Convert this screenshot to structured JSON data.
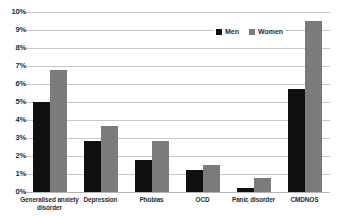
{
  "chart_data": {
    "type": "bar",
    "title": "",
    "subtitle": "",
    "xlabel": "",
    "ylabel": "",
    "ylim": [
      0,
      10
    ],
    "ytick_labels": [
      "10%",
      "9%",
      "8%",
      "7%",
      "6%",
      "5%",
      "4%",
      "3%",
      "2%",
      "1%",
      "0%"
    ],
    "ytick_values": [
      10,
      9,
      8,
      7,
      6,
      5,
      4,
      3,
      2,
      1,
      0
    ],
    "grid": true,
    "legend_position": "top-right",
    "value_unit": "%",
    "categories": [
      "Generalised anxiety disorder",
      "Depression",
      "Phobias",
      "OCD",
      "Panic disorder",
      "CMDNOS"
    ],
    "category_lines": [
      [
        "Generalised anxiety",
        "disorder"
      ],
      [
        "Depression"
      ],
      [
        "Phobias"
      ],
      [
        "OCD"
      ],
      [
        "Panic disorder"
      ],
      [
        "CMDNOS"
      ]
    ],
    "series": [
      {
        "name": "Men",
        "color": "#101010",
        "values": [
          5.0,
          2.85,
          1.8,
          1.2,
          0.2,
          5.75
        ]
      },
      {
        "name": "Women",
        "color": "#7b7b7b",
        "values": [
          6.8,
          3.65,
          2.85,
          1.5,
          0.8,
          9.5
        ]
      }
    ]
  },
  "legend": {
    "items": [
      {
        "label": "Men",
        "color": "#101010"
      },
      {
        "label": "Women",
        "color": "#7b7b7b"
      }
    ]
  },
  "colors": {
    "men": "#101010",
    "women": "#7b7b7b",
    "gridline": "#c8c8c8",
    "baseline": "#b4b4b4",
    "text": "#2b2b2b",
    "background": "#ffffff"
  }
}
